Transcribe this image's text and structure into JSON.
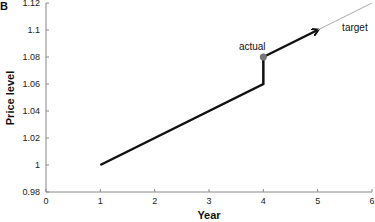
{
  "panel_label": "B",
  "chart_data": {
    "type": "line",
    "title": "",
    "xlabel": "Year",
    "ylabel": "Price level",
    "xlim": [
      0,
      6
    ],
    "ylim": [
      0.98,
      1.12
    ],
    "xticks": [
      "0",
      "1",
      "2",
      "3",
      "4",
      "5",
      "6"
    ],
    "yticks": [
      "0.98",
      "1",
      "1.02",
      "1.04",
      "1.06",
      "1.08",
      "1.1",
      "1.12"
    ],
    "grid": false,
    "series": [
      {
        "name": "path",
        "style": "thick-black",
        "points": [
          [
            1,
            1.0
          ],
          [
            4,
            1.06
          ],
          [
            4,
            1.08
          ]
        ]
      },
      {
        "name": "actual-arrow",
        "style": "thick-black-arrow",
        "points": [
          [
            4,
            1.08
          ],
          [
            5,
            1.1
          ]
        ]
      },
      {
        "name": "target",
        "style": "thin-gray",
        "points": [
          [
            5,
            1.1
          ],
          [
            6,
            1.12
          ]
        ]
      }
    ],
    "markers": [
      {
        "label": "actual",
        "x": 4,
        "y": 1.08,
        "color": "#777777"
      }
    ],
    "annotations": [
      {
        "text": "actual",
        "x": 3.55,
        "y": 1.085
      },
      {
        "text": "target",
        "x": 5.45,
        "y": 1.099
      }
    ]
  }
}
